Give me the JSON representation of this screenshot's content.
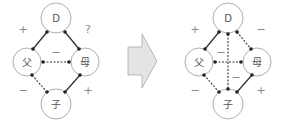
{
  "diagrams": [
    {
      "id": "before",
      "nodes": [
        {
          "key": "D",
          "label": "D",
          "x": 56,
          "y": 18,
          "r": 15
        },
        {
          "key": "father",
          "label": "父",
          "x": 27,
          "y": 62,
          "r": 14
        },
        {
          "key": "mother",
          "label": "母",
          "x": 85,
          "y": 62,
          "r": 14
        },
        {
          "key": "child",
          "label": "子",
          "x": 56,
          "y": 104,
          "r": 15
        }
      ],
      "edges": [
        {
          "from": [
            47,
            32
          ],
          "to": [
            33,
            49
          ],
          "style": "solid"
        },
        {
          "from": [
            65,
            32
          ],
          "to": [
            79,
            49
          ],
          "style": "solid"
        },
        {
          "from": [
            43,
            62
          ],
          "to": [
            69,
            62
          ],
          "style": "dashed"
        },
        {
          "from": [
            32,
            75
          ],
          "to": [
            47,
            92
          ],
          "style": "dashed"
        },
        {
          "from": [
            80,
            75
          ],
          "to": [
            65,
            92
          ],
          "style": "solid"
        }
      ],
      "signs": [
        {
          "text": "+",
          "x": 23,
          "y": 29
        },
        {
          "text": "?",
          "x": 88,
          "y": 29
        },
        {
          "text": "−",
          "x": 56,
          "y": 52
        },
        {
          "text": "−",
          "x": 23,
          "y": 90
        },
        {
          "text": "+",
          "x": 88,
          "y": 90
        }
      ]
    },
    {
      "id": "after",
      "nodes": [
        {
          "key": "D",
          "label": "D",
          "x": 228,
          "y": 18,
          "r": 15
        },
        {
          "key": "father",
          "label": "父",
          "x": 199,
          "y": 62,
          "r": 14
        },
        {
          "key": "mother",
          "label": "母",
          "x": 257,
          "y": 62,
          "r": 14
        },
        {
          "key": "child",
          "label": "子",
          "x": 228,
          "y": 104,
          "r": 15
        }
      ],
      "edges": [
        {
          "from": [
            219,
            32
          ],
          "to": [
            205,
            49
          ],
          "style": "solid"
        },
        {
          "from": [
            237,
            32
          ],
          "to": [
            251,
            49
          ],
          "style": "dashed"
        },
        {
          "from": [
            228,
            34
          ],
          "to": [
            228,
            89
          ],
          "style": "dashed"
        },
        {
          "from": [
            215,
            62
          ],
          "to": [
            241,
            62
          ],
          "style": "dashed"
        },
        {
          "from": [
            204,
            75
          ],
          "to": [
            219,
            92
          ],
          "style": "dashed"
        },
        {
          "from": [
            252,
            75
          ],
          "to": [
            237,
            92
          ],
          "style": "solid"
        }
      ],
      "signs": [
        {
          "text": "+",
          "x": 195,
          "y": 29
        },
        {
          "text": "−",
          "x": 261,
          "y": 29
        },
        {
          "text": "−",
          "x": 221,
          "y": 52
        },
        {
          "text": "−",
          "x": 236,
          "y": 77
        },
        {
          "text": "−",
          "x": 195,
          "y": 90
        },
        {
          "text": "+",
          "x": 261,
          "y": 90
        }
      ]
    }
  ],
  "arrow": {
    "direction": "right",
    "fill": "#e4e4e4",
    "stroke": "#aaaaaa"
  },
  "colors": {
    "line": "#333333",
    "circle": "#999999",
    "dot": "#222222"
  }
}
